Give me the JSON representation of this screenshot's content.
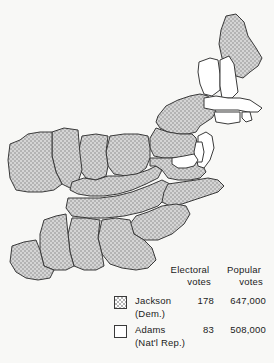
{
  "figure": {
    "kind": "electoral-map",
    "region": "Eastern United States",
    "background_color": "#f8f8f6",
    "outline_color": "#3a3a3a",
    "jackson_fill_color": "#b4b4b4",
    "adams_fill_color": "#ffffff"
  },
  "legend": {
    "headers": {
      "electoral_line1": "Electoral",
      "electoral_line2": "votes",
      "popular_line1": "Popular",
      "popular_line2": "votes"
    },
    "rows": [
      {
        "swatch": "stippled-gray-swatch",
        "candidate": "Jackson",
        "party": "(Dem.)",
        "electoral_votes": "178",
        "popular_votes": "647,000"
      },
      {
        "swatch": "white-swatch",
        "candidate": "Adams",
        "party": "(Nat'l Rep.)",
        "electoral_votes": "83",
        "popular_votes": "508,000"
      }
    ]
  },
  "map": {
    "jackson_states": [
      "Maine",
      "New York",
      "Pennsylvania",
      "Virginia",
      "North Carolina",
      "South Carolina",
      "Georgia",
      "Alabama",
      "Mississippi",
      "Louisiana",
      "Tennessee",
      "Kentucky",
      "Ohio",
      "Indiana",
      "Illinois",
      "Missouri"
    ],
    "adams_states": [
      "Vermont",
      "New Hampshire",
      "Massachusetts",
      "Rhode Island",
      "Connecticut",
      "New Jersey",
      "Delaware",
      "Maryland"
    ]
  }
}
